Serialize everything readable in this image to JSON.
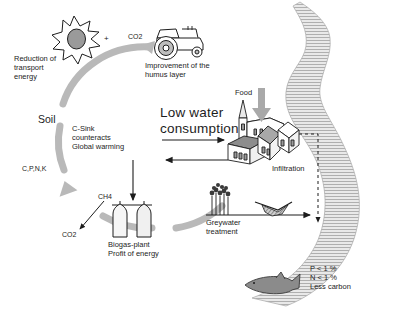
{
  "diagram": {
    "type": "process-cycle",
    "background": "#ffffff",
    "cycle_color": "#b9b9b9",
    "ink_color": "#1d1d1d",
    "fill_gray": "#8f8f8f"
  },
  "labels": {
    "co2_top": "CO2",
    "plus": "+",
    "reduction": "Reduction of\ntransport\nenergy",
    "humus": "Improvement of the\nhumus layer",
    "soil": "Soil",
    "csink": "C-Sink\ncounteracts\nGlobal warming",
    "cpnk": "C,P,N,K",
    "ch4": "CH4",
    "co2_bottom": "CO2",
    "biogas": "Biogas-plant\nProfit of energy",
    "lowwater": "Low water\nconsumption",
    "food": "Food",
    "infiltration": "Infiltration",
    "greywater": "Greywater\ntreatment",
    "water_quality": "P < 1 %\nN < 1 %\nLess carbon"
  },
  "icons": {
    "sun": "sun-starburst-icon",
    "tractor": "tractor-icon",
    "village": "village-houses-icon",
    "church": "church-steeple-icon",
    "biogas_tanks": "biogas-tanks-icon",
    "reeds": "reed-plants-icon",
    "basin": "infiltration-basin-icon",
    "fish": "fish-icon",
    "river": "river-icon",
    "food_arrow": "food-down-arrow-icon",
    "cycle_ring": "cycle-ring-arrows-icon"
  }
}
